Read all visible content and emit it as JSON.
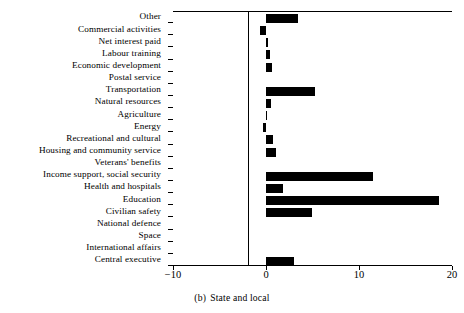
{
  "chart_data": {
    "type": "bar",
    "orientation": "horizontal",
    "title": "",
    "caption_index": "(b)",
    "caption_text": "State and local",
    "xlabel": "",
    "ylabel": "",
    "xlim": [
      -10,
      20
    ],
    "xticks": [
      -10,
      0,
      10,
      20
    ],
    "xticklabels": [
      "−10",
      "0",
      "10",
      "20"
    ],
    "grid": false,
    "legend": null,
    "zero_line": true,
    "categories": [
      "Other",
      "Commercial activities",
      "Net interest paid",
      "Labour training",
      "Economic development",
      "Postal service",
      "Transportation",
      "Natural resources",
      "Agriculture",
      "Energy",
      "Recreational and cultural",
      "Housing and community service",
      "Veterans' benefits",
      "Income support, social security",
      "Health and hospitals",
      "Education",
      "Civilian safety",
      "National defence",
      "Space",
      "International affairs",
      "Central executive"
    ],
    "values": [
      3.4,
      -0.6,
      0.2,
      0.4,
      0.6,
      0.0,
      5.3,
      0.5,
      0.1,
      -0.3,
      0.7,
      1.1,
      0.0,
      11.5,
      1.8,
      18.6,
      4.9,
      0.0,
      0.0,
      0.0,
      3.0
    ],
    "bar_color": "#000000",
    "axis_color": "#000000"
  }
}
